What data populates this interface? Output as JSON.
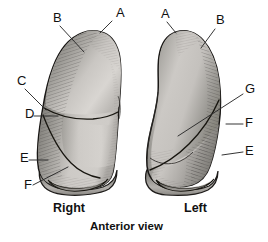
{
  "figure": {
    "title": "Anterior view",
    "style": "grayscale-pen-and-ink-anatomical-illustration"
  },
  "captions": {
    "right_label": "Right",
    "left_label": "Left",
    "view_label": "Anterior view"
  },
  "callouts": {
    "right_lung": [
      {
        "id": "A",
        "letter": "A",
        "text_x": 116,
        "text_y": 17,
        "line_x1": 112,
        "line_y1": 21,
        "line_x2": 100,
        "line_y2": 33
      },
      {
        "id": "B",
        "letter": "B",
        "text_x": 53,
        "text_y": 22,
        "line_x1": 60,
        "line_y1": 26,
        "line_x2": 84,
        "line_y2": 52
      },
      {
        "id": "C",
        "letter": "C",
        "text_x": 17,
        "text_y": 85,
        "line_x1": 25,
        "line_y1": 89,
        "line_x2": 46,
        "line_y2": 110
      },
      {
        "id": "D",
        "letter": "D",
        "text_x": 25,
        "text_y": 118,
        "line_x1": 34,
        "line_y1": 116,
        "line_x2": 58,
        "line_y2": 116
      },
      {
        "id": "E",
        "letter": "E",
        "text_x": 20,
        "text_y": 162,
        "line_x1": 29,
        "line_y1": 160,
        "line_x2": 48,
        "line_y2": 160
      },
      {
        "id": "F",
        "letter": "F",
        "text_x": 24,
        "text_y": 189,
        "line_x1": 33,
        "line_y1": 185,
        "line_x2": 68,
        "line_y2": 167
      }
    ],
    "left_lung": [
      {
        "id": "A",
        "letter": "A",
        "text_x": 161,
        "text_y": 18,
        "line_x1": 167,
        "line_y1": 22,
        "line_x2": 176,
        "line_y2": 33
      },
      {
        "id": "B",
        "letter": "B",
        "text_x": 216,
        "text_y": 24,
        "line_x1": 215,
        "line_y1": 29,
        "line_x2": 201,
        "line_y2": 48
      },
      {
        "id": "G",
        "letter": "G",
        "text_x": 245,
        "text_y": 93,
        "line_x1": 243,
        "line_y1": 94,
        "line_x2": 178,
        "line_y2": 136
      },
      {
        "id": "F",
        "letter": "F",
        "text_x": 245,
        "text_y": 127,
        "line_x1": 243,
        "line_y1": 124,
        "line_x2": 226,
        "line_y2": 124
      },
      {
        "id": "E",
        "letter": "E",
        "text_x": 245,
        "text_y": 155,
        "line_x1": 243,
        "line_y1": 152,
        "line_x2": 222,
        "line_y2": 155
      }
    ]
  },
  "colors": {
    "ink": "#1a1a1a",
    "background": "#ffffff",
    "tissue_light": "#d6d4d2",
    "tissue_mid": "#b9b7b5",
    "tissue_dark": "#8e8c8a",
    "tissue_shadow": "#6e6c6a",
    "leader_line": "#2a2a2a",
    "caption_text": "#111111"
  },
  "structures": {
    "right_lung": {
      "name": "right-lung",
      "lobes": [
        "superior-lobe",
        "middle-lobe",
        "inferior-lobe"
      ],
      "fissures": [
        "horizontal-fissure",
        "oblique-fissure"
      ]
    },
    "left_lung": {
      "name": "left-lung",
      "lobes": [
        "superior-lobe",
        "inferior-lobe"
      ],
      "fissures": [
        "oblique-fissure"
      ],
      "features": [
        "cardiac-notch",
        "lingula"
      ]
    }
  }
}
